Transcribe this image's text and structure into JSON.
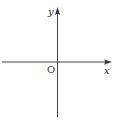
{
  "diagram": {
    "type": "coordinate-axes",
    "labels": {
      "x_axis": "x",
      "y_axis": "y",
      "origin": "O"
    },
    "colors": {
      "axis": "#444444",
      "background": "#ffffff"
    }
  }
}
